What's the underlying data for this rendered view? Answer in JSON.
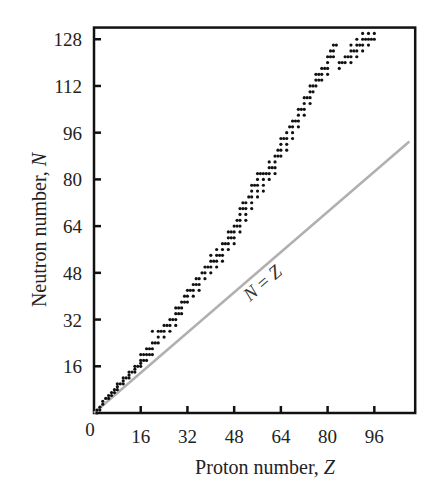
{
  "chart_data": {
    "type": "scatter",
    "title": "",
    "xlabel": "Proton number, ",
    "xlabel_var": "Z",
    "ylabel": "Neutron number, ",
    "ylabel_var": "N",
    "xlim": [
      0,
      110
    ],
    "ylim": [
      0,
      132
    ],
    "grid": false,
    "legend": null,
    "x_ticks": [
      16,
      32,
      48,
      64,
      80,
      96
    ],
    "x_tick_labels": [
      "16",
      "32",
      "48",
      "64",
      "80",
      "96"
    ],
    "y_ticks": [
      16,
      32,
      48,
      64,
      80,
      96,
      112,
      128
    ],
    "y_tick_labels": [
      "16",
      "32",
      "48",
      "64",
      "80",
      "96",
      "112",
      "128"
    ],
    "origin_label": "0",
    "reference_line": {
      "label_left": "N",
      "label_eq": " = ",
      "label_right": "Z",
      "from": [
        0,
        0
      ],
      "to": [
        108,
        93
      ],
      "color": "#b0b0b0"
    },
    "series": [
      {
        "name": "stable nuclides",
        "color": "#111111",
        "points": [
          [
            1,
            0
          ],
          [
            1,
            1
          ],
          [
            2,
            1
          ],
          [
            2,
            2
          ],
          [
            3,
            3
          ],
          [
            3,
            4
          ],
          [
            4,
            5
          ],
          [
            5,
            5
          ],
          [
            5,
            6
          ],
          [
            6,
            6
          ],
          [
            6,
            7
          ],
          [
            7,
            7
          ],
          [
            7,
            8
          ],
          [
            8,
            8
          ],
          [
            8,
            9
          ],
          [
            8,
            10
          ],
          [
            9,
            10
          ],
          [
            10,
            10
          ],
          [
            10,
            11
          ],
          [
            10,
            12
          ],
          [
            11,
            12
          ],
          [
            12,
            12
          ],
          [
            12,
            13
          ],
          [
            12,
            14
          ],
          [
            13,
            14
          ],
          [
            14,
            14
          ],
          [
            14,
            15
          ],
          [
            14,
            16
          ],
          [
            15,
            16
          ],
          [
            16,
            16
          ],
          [
            16,
            17
          ],
          [
            16,
            18
          ],
          [
            16,
            20
          ],
          [
            17,
            18
          ],
          [
            17,
            20
          ],
          [
            18,
            18
          ],
          [
            18,
            20
          ],
          [
            18,
            22
          ],
          [
            19,
            20
          ],
          [
            19,
            22
          ],
          [
            20,
            20
          ],
          [
            20,
            22
          ],
          [
            20,
            24
          ],
          [
            20,
            28
          ],
          [
            21,
            24
          ],
          [
            22,
            24
          ],
          [
            22,
            26
          ],
          [
            22,
            28
          ],
          [
            23,
            28
          ],
          [
            24,
            26
          ],
          [
            24,
            28
          ],
          [
            24,
            30
          ],
          [
            25,
            30
          ],
          [
            26,
            28
          ],
          [
            26,
            30
          ],
          [
            26,
            32
          ],
          [
            27,
            32
          ],
          [
            28,
            30
          ],
          [
            28,
            32
          ],
          [
            28,
            34
          ],
          [
            28,
            36
          ],
          [
            29,
            34
          ],
          [
            29,
            36
          ],
          [
            30,
            34
          ],
          [
            30,
            36
          ],
          [
            30,
            38
          ],
          [
            31,
            38
          ],
          [
            31,
            40
          ],
          [
            32,
            38
          ],
          [
            32,
            40
          ],
          [
            32,
            42
          ],
          [
            33,
            42
          ],
          [
            34,
            40
          ],
          [
            34,
            42
          ],
          [
            34,
            44
          ],
          [
            35,
            44
          ],
          [
            35,
            46
          ],
          [
            36,
            42
          ],
          [
            36,
            44
          ],
          [
            36,
            46
          ],
          [
            37,
            48
          ],
          [
            38,
            46
          ],
          [
            38,
            48
          ],
          [
            38,
            50
          ],
          [
            39,
            50
          ],
          [
            40,
            48
          ],
          [
            40,
            50
          ],
          [
            40,
            52
          ],
          [
            40,
            54
          ],
          [
            41,
            52
          ],
          [
            42,
            50
          ],
          [
            42,
            52
          ],
          [
            42,
            54
          ],
          [
            42,
            56
          ],
          [
            43,
            54
          ],
          [
            44,
            52
          ],
          [
            44,
            54
          ],
          [
            44,
            56
          ],
          [
            44,
            58
          ],
          [
            45,
            58
          ],
          [
            46,
            56
          ],
          [
            46,
            58
          ],
          [
            46,
            60
          ],
          [
            46,
            62
          ],
          [
            47,
            60
          ],
          [
            47,
            62
          ],
          [
            48,
            58
          ],
          [
            48,
            60
          ],
          [
            48,
            62
          ],
          [
            48,
            64
          ],
          [
            49,
            64
          ],
          [
            49,
            66
          ],
          [
            50,
            62
          ],
          [
            50,
            64
          ],
          [
            50,
            66
          ],
          [
            50,
            68
          ],
          [
            50,
            70
          ],
          [
            51,
            70
          ],
          [
            51,
            72
          ],
          [
            52,
            66
          ],
          [
            52,
            68
          ],
          [
            52,
            70
          ],
          [
            52,
            72
          ],
          [
            53,
            74
          ],
          [
            54,
            70
          ],
          [
            54,
            72
          ],
          [
            54,
            74
          ],
          [
            54,
            76
          ],
          [
            54,
            78
          ],
          [
            55,
            78
          ],
          [
            56,
            74
          ],
          [
            56,
            76
          ],
          [
            56,
            78
          ],
          [
            56,
            80
          ],
          [
            56,
            82
          ],
          [
            57,
            82
          ],
          [
            58,
            76
          ],
          [
            58,
            78
          ],
          [
            58,
            80
          ],
          [
            58,
            82
          ],
          [
            59,
            82
          ],
          [
            60,
            80
          ],
          [
            60,
            82
          ],
          [
            60,
            84
          ],
          [
            60,
            86
          ],
          [
            61,
            84
          ],
          [
            62,
            82
          ],
          [
            62,
            84
          ],
          [
            62,
            86
          ],
          [
            62,
            88
          ],
          [
            63,
            88
          ],
          [
            63,
            90
          ],
          [
            64,
            88
          ],
          [
            64,
            90
          ],
          [
            64,
            92
          ],
          [
            64,
            94
          ],
          [
            65,
            94
          ],
          [
            66,
            90
          ],
          [
            66,
            92
          ],
          [
            66,
            94
          ],
          [
            66,
            96
          ],
          [
            67,
            98
          ],
          [
            68,
            94
          ],
          [
            68,
            96
          ],
          [
            68,
            98
          ],
          [
            68,
            100
          ],
          [
            69,
            100
          ],
          [
            70,
            98
          ],
          [
            70,
            100
          ],
          [
            70,
            102
          ],
          [
            70,
            104
          ],
          [
            71,
            104
          ],
          [
            72,
            102
          ],
          [
            72,
            104
          ],
          [
            72,
            106
          ],
          [
            72,
            108
          ],
          [
            73,
            108
          ],
          [
            74,
            106
          ],
          [
            74,
            108
          ],
          [
            74,
            110
          ],
          [
            74,
            112
          ],
          [
            75,
            110
          ],
          [
            75,
            112
          ],
          [
            76,
            112
          ],
          [
            76,
            114
          ],
          [
            76,
            116
          ],
          [
            77,
            114
          ],
          [
            77,
            116
          ],
          [
            78,
            114
          ],
          [
            78,
            116
          ],
          [
            78,
            118
          ],
          [
            79,
            118
          ],
          [
            80,
            116
          ],
          [
            80,
            118
          ],
          [
            80,
            120
          ],
          [
            80,
            122
          ],
          [
            81,
            122
          ],
          [
            81,
            124
          ],
          [
            82,
            122
          ],
          [
            82,
            124
          ],
          [
            82,
            126
          ],
          [
            83,
            126
          ],
          [
            84,
            118
          ],
          [
            84,
            120
          ],
          [
            85,
            120
          ],
          [
            86,
            120
          ],
          [
            86,
            122
          ],
          [
            87,
            122
          ],
          [
            88,
            120
          ],
          [
            88,
            122
          ],
          [
            88,
            124
          ],
          [
            88,
            126
          ],
          [
            89,
            124
          ],
          [
            90,
            122
          ],
          [
            90,
            124
          ],
          [
            90,
            126
          ],
          [
            90,
            128
          ],
          [
            91,
            126
          ],
          [
            92,
            124
          ],
          [
            92,
            126
          ],
          [
            92,
            128
          ],
          [
            92,
            130
          ],
          [
            93,
            128
          ],
          [
            94,
            126
          ],
          [
            94,
            128
          ],
          [
            94,
            130
          ],
          [
            95,
            128
          ],
          [
            96,
            128
          ],
          [
            96,
            130
          ]
        ]
      }
    ]
  }
}
